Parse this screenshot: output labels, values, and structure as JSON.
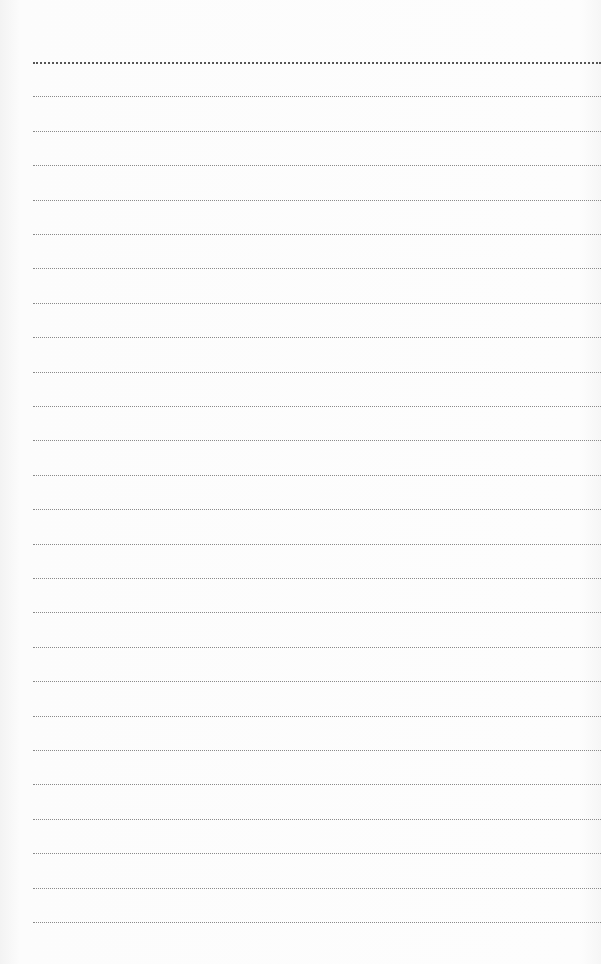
{
  "page": {
    "type": "lined-paper",
    "background_color": "#fcfcfc",
    "line_color": "#8a8a8a",
    "line_style": "dotted",
    "line_count": 26,
    "first_line_y": 62,
    "line_spacing": 34.4,
    "left_margin": 33
  }
}
